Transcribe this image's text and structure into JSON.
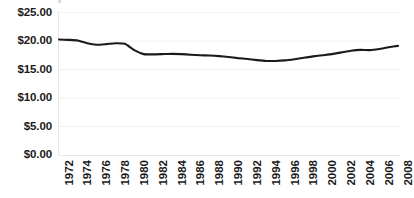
{
  "chart_data": {
    "type": "line",
    "title": "",
    "xlabel": "",
    "ylabel": "",
    "ylim": [
      0,
      25
    ],
    "xlim": [
      1972,
      2008
    ],
    "grid": true,
    "legend": "none",
    "y_tick_labels": [
      "$0.00",
      "$5.00",
      "$10.00",
      "$15.00",
      "$20.00",
      "$25.00"
    ],
    "y_tick_values": [
      0,
      5,
      10,
      15,
      20,
      25
    ],
    "x_tick_labels": [
      "1972",
      "1974",
      "1976",
      "1978",
      "1980",
      "1982",
      "1984",
      "1986",
      "1988",
      "1990",
      "1992",
      "1994",
      "1996",
      "1998",
      "2000",
      "2002",
      "2004",
      "2006",
      "2008"
    ],
    "x": [
      1972,
      1973,
      1974,
      1975,
      1976,
      1977,
      1978,
      1979,
      1980,
      1981,
      1982,
      1983,
      1984,
      1985,
      1986,
      1987,
      1988,
      1989,
      1990,
      1991,
      1992,
      1993,
      1994,
      1995,
      1996,
      1997,
      1998,
      1999,
      2000,
      2001,
      2002,
      2003,
      2004,
      2005,
      2006,
      2007,
      2008
    ],
    "series": [
      {
        "name": "Value",
        "values": [
          20.25,
          20.2,
          20.1,
          19.6,
          19.35,
          19.45,
          19.6,
          19.5,
          18.4,
          17.7,
          17.65,
          17.7,
          17.75,
          17.7,
          17.6,
          17.5,
          17.45,
          17.35,
          17.2,
          17.0,
          16.85,
          16.65,
          16.5,
          16.5,
          16.6,
          16.8,
          17.05,
          17.3,
          17.5,
          17.7,
          18.0,
          18.3,
          18.45,
          18.4,
          18.6,
          18.9,
          19.15
        ]
      }
    ],
    "line_color": "#1a1a1a",
    "grid_color": "#f2f2f2"
  }
}
